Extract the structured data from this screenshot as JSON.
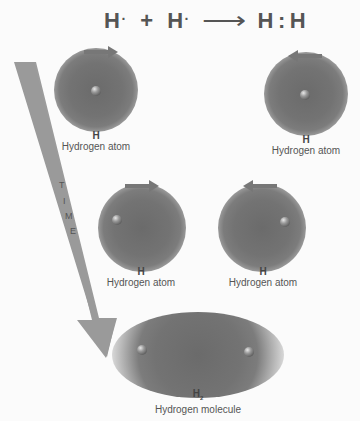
{
  "equation": {
    "reactant1": "H",
    "dot1": "·",
    "plus": "+",
    "reactant2": "H",
    "dot2": "·",
    "arrow": "⟶",
    "product_left": "H",
    "colon": ":",
    "product_right": "H"
  },
  "time_arrow": {
    "letters": [
      "T",
      "I",
      "M",
      "E"
    ],
    "color": "#9a9a9a"
  },
  "stages": [
    {
      "atoms": [
        {
          "symbol": "H",
          "name": "Hydrogen atom",
          "motion": "right"
        },
        {
          "symbol": "H",
          "name": "Hydrogen atom",
          "motion": "left"
        }
      ]
    },
    {
      "atoms": [
        {
          "symbol": "H",
          "name": "Hydrogen atom",
          "motion": "right"
        },
        {
          "symbol": "H",
          "name": "Hydrogen atom",
          "motion": "left"
        }
      ]
    },
    {
      "molecule": {
        "symbol": "H",
        "subscript": "2",
        "name": "Hydrogen molecule"
      }
    }
  ],
  "colors": {
    "electron_cloud": "#737373",
    "motion_arrow": "#777777",
    "label_text": "#555555"
  }
}
